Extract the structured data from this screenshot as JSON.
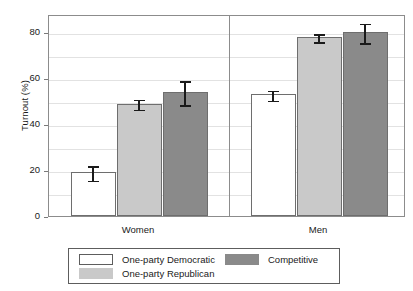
{
  "chart_data": {
    "type": "bar",
    "title": "",
    "xlabel": "",
    "ylabel": "Turnout (%)",
    "ylim": [
      0,
      88
    ],
    "yticks": [
      0,
      20,
      40,
      60,
      80
    ],
    "ytick_labels": [
      "0",
      "20",
      "40",
      "60",
      "80"
    ],
    "grid": true,
    "grid_axis": "y",
    "legend_position": "bottom",
    "categories": [
      "Women",
      "Men"
    ],
    "series": [
      {
        "name": "One-party Democratic",
        "color": "#ffffff",
        "edge_color": "#6e6e6e",
        "values": [
          19,
          53
        ],
        "errors": [
          3.5,
          2.5
        ]
      },
      {
        "name": "One-party Republican",
        "color": "#c9c9c9",
        "edge_color": "#6e6e6e",
        "values": [
          49,
          78
        ],
        "errors": [
          2.5,
          2.0
        ]
      },
      {
        "name": "Competitive",
        "color": "#8a8a8a",
        "edge_color": "#6e6e6e",
        "values": [
          54,
          80
        ],
        "errors": [
          5.5,
          4.5
        ]
      }
    ]
  },
  "axes": {
    "y_title": "Turnout (%)",
    "tick_labels": [
      "80",
      "60",
      "40",
      "20",
      "0"
    ],
    "group_labels": [
      "Women",
      "Men"
    ]
  },
  "legend": {
    "items": [
      {
        "label": "One-party Democratic",
        "color": "#ffffff",
        "outlined": true
      },
      {
        "label": "One-party Republican",
        "color": "#c9c9c9",
        "outlined": false
      },
      {
        "label": "Competitive",
        "color": "#8a8a8a",
        "outlined": false
      }
    ]
  }
}
